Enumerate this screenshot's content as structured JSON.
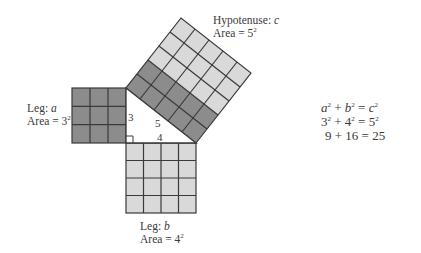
{
  "diagram": {
    "colors": {
      "dark_cell": "#8c8c8c",
      "light_cell": "#d9d9d9",
      "grid_line": "#3a3a3a",
      "text": "#3a3a3a"
    },
    "triangle": {
      "side_a": "3",
      "side_b": "4",
      "side_c": "5",
      "right_angle_marker": true
    },
    "squares": {
      "leg_a": {
        "name": "Leg:",
        "var": "a",
        "area_prefix": "Area = ",
        "area_base": "3",
        "area_exp": "2",
        "grid": 3,
        "shade": "dark"
      },
      "leg_b": {
        "name": "Leg:",
        "var": "b",
        "area_prefix": "Area = ",
        "area_base": "4",
        "area_exp": "2",
        "grid": 4,
        "shade": "light"
      },
      "hypotenuse": {
        "name": "Hypotenuse:",
        "var": "c",
        "area_prefix": "Area = ",
        "area_base": "5",
        "area_exp": "2",
        "grid": 5,
        "dark_cells": 10,
        "light_cells": 15
      }
    },
    "equations": [
      {
        "lhs1": "a",
        "e1": "2",
        "op": " + ",
        "lhs2": "b",
        "e2": "2",
        "eq": " = ",
        "rhs": "c",
        "e3": "2"
      },
      {
        "lhs1": "3",
        "e1": "2",
        "op": " + ",
        "lhs2": "4",
        "e2": "2",
        "eq": " = ",
        "rhs": "5",
        "e3": "2"
      },
      {
        "text": "9 + 16 = 25"
      }
    ]
  }
}
